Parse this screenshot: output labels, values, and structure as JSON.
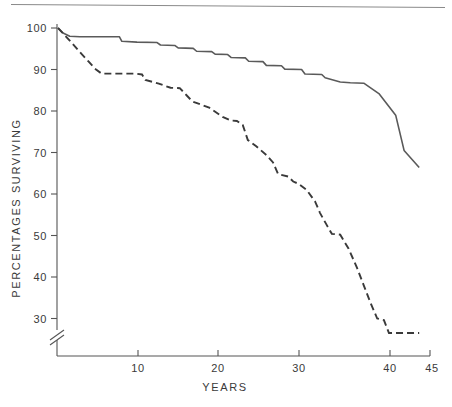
{
  "chart_data": {
    "type": "line",
    "title": "",
    "subtitle": "",
    "xlabel": "YEARS",
    "ylabel": "PERCENTAGES SURVIVING",
    "xlim": [
      0,
      45
    ],
    "ylim": [
      26,
      100
    ],
    "y_axis_break": true,
    "y_axis_break_note": "axis broken below 30",
    "grid": false,
    "legend_position": "none",
    "xticks": [
      10,
      20,
      30,
      40,
      45
    ],
    "xtick_labels": [
      "10",
      "20",
      "30",
      "40",
      "45"
    ],
    "yticks": [
      30,
      40,
      50,
      60,
      70,
      80,
      90,
      100
    ],
    "ytick_labels": [
      "30",
      "40",
      "50",
      "60",
      "70",
      "80",
      "90",
      "100"
    ],
    "series": [
      {
        "name": "solid-curve",
        "style": "solid",
        "color": "#5a5a5a",
        "x": [
          0,
          0.6,
          1.4,
          2.6,
          7.3,
          7.6,
          9.4,
          11.8,
          12.2,
          13.9,
          14.3,
          16.1,
          16.5,
          18.3,
          18.7,
          20.2,
          20.6,
          22.3,
          22.7,
          24.4,
          24.8,
          26.6,
          27.0,
          29.0,
          29.4,
          31.4,
          31.8,
          33.6,
          34.8,
          36.4,
          38.2,
          40.2,
          41.2,
          43.0
        ],
        "y": [
          100.0,
          98.8,
          98.0,
          97.9,
          97.9,
          96.8,
          96.6,
          96.5,
          95.9,
          95.8,
          95.2,
          95.1,
          94.4,
          94.3,
          93.7,
          93.6,
          92.9,
          92.8,
          92.0,
          91.9,
          91.0,
          90.9,
          90.1,
          90.0,
          88.9,
          88.8,
          88.0,
          87.0,
          86.8,
          86.7,
          84.2,
          79.0,
          70.5,
          66.4
        ]
      },
      {
        "name": "dashed-curve",
        "style": "dashed",
        "color": "#3a3a3a",
        "x": [
          0,
          0.7,
          1.6,
          2.6,
          3.6,
          4.4,
          5.2,
          9.2,
          10.0,
          10.4,
          12.0,
          13.4,
          14.5,
          15.3,
          16.0,
          18.0,
          19.6,
          20.6,
          21.3,
          22.0,
          22.6,
          23.6,
          24.8,
          25.6,
          26.2,
          27.4,
          28.0,
          28.6,
          29.6,
          30.6,
          31.2,
          32.0,
          32.6,
          33.6,
          34.6,
          35.6,
          36.4,
          37.2,
          38.0,
          38.8,
          39.4,
          43.0
        ],
        "y": [
          100.0,
          98.5,
          96.5,
          94.2,
          92.0,
          90.2,
          89.0,
          89.0,
          88.8,
          87.5,
          86.6,
          85.6,
          85.5,
          83.8,
          82.3,
          80.8,
          78.6,
          77.7,
          77.6,
          76.6,
          73.0,
          71.5,
          69.4,
          67.6,
          64.8,
          64.2,
          63.0,
          62.5,
          61.0,
          58.2,
          55.4,
          52.5,
          50.4,
          50.2,
          46.8,
          42.2,
          38.0,
          33.8,
          30.0,
          29.6,
          26.5,
          26.5
        ]
      }
    ]
  },
  "axis": {
    "y_title": "PERCENTAGES SURVIVING",
    "x_title": "YEARS"
  },
  "colors": {
    "axis": "#555555",
    "solid_series": "#5a5a5a",
    "dashed_series": "#3a3a3a",
    "top_rule": "#8a8a8a",
    "background": "#ffffff"
  }
}
